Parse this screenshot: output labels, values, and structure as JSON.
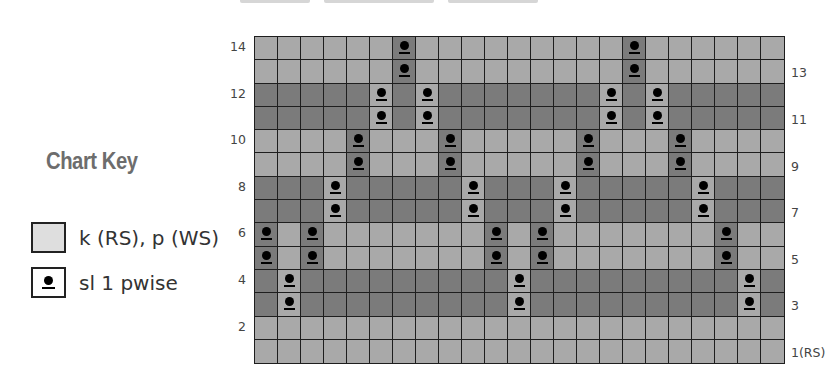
{
  "colors": {
    "light_cell": "#a9a9a9",
    "dark_cell": "#7b7b7b",
    "grid_line": "#1e1e1e",
    "key_title": "#6d6d6d",
    "key_plain_fill": "#dedede"
  },
  "key": {
    "title": "Chart Key",
    "items": [
      {
        "symbol": "plain-square-icon",
        "label": "k (RS), p (WS)"
      },
      {
        "symbol": "slip-dot-icon",
        "label": "sl 1 pwise"
      }
    ]
  },
  "chart": {
    "columns": 23,
    "rows": 14,
    "left_labels": [
      "14",
      "12",
      "10",
      "8",
      "6",
      "4",
      "2"
    ],
    "right_labels": [
      "13",
      "11",
      "9",
      "7",
      "5",
      "3",
      "1(RS)"
    ],
    "row_defs": [
      {
        "row": 14,
        "shade": "light",
        "slips": [
          7,
          17
        ]
      },
      {
        "row": 13,
        "shade": "light",
        "slips": [
          7,
          17
        ]
      },
      {
        "row": 12,
        "shade": "dark",
        "slips": [
          6,
          8,
          16,
          18
        ]
      },
      {
        "row": 11,
        "shade": "dark",
        "slips": [
          6,
          8,
          16,
          18
        ]
      },
      {
        "row": 10,
        "shade": "light",
        "slips": [
          5,
          9,
          15,
          19
        ]
      },
      {
        "row": 9,
        "shade": "light",
        "slips": [
          5,
          9,
          15,
          19
        ]
      },
      {
        "row": 8,
        "shade": "dark",
        "slips": [
          4,
          10,
          14,
          20
        ]
      },
      {
        "row": 7,
        "shade": "dark",
        "slips": [
          4,
          10,
          14,
          20
        ]
      },
      {
        "row": 6,
        "shade": "light",
        "slips": [
          1,
          3,
          11,
          13,
          21
        ]
      },
      {
        "row": 5,
        "shade": "light",
        "slips": [
          1,
          3,
          11,
          13,
          21
        ]
      },
      {
        "row": 4,
        "shade": "dark",
        "slips": [
          2,
          12,
          22
        ]
      },
      {
        "row": 3,
        "shade": "dark",
        "slips": [
          2,
          12,
          22
        ]
      },
      {
        "row": 2,
        "shade": "light",
        "slips": []
      },
      {
        "row": 1,
        "shade": "light",
        "slips": []
      }
    ]
  }
}
